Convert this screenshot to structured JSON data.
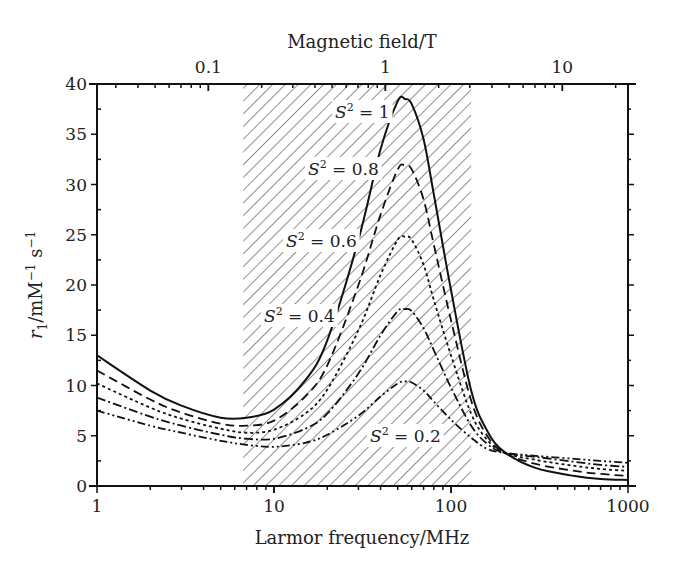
{
  "chart_data": {
    "type": "line",
    "title": "",
    "xlabel": "Larmor frequency/MHz",
    "x2label": "Magnetic field/T",
    "ylabel": "r1/mM-1 s-1",
    "xscale": "log",
    "xlim": [
      1,
      1000
    ],
    "ylim": [
      0,
      40
    ],
    "x_ticks": [
      1,
      10,
      100,
      1000
    ],
    "x_tick_labels": [
      "1",
      "10",
      "100",
      "1000"
    ],
    "x2_ticks": [
      0.1,
      1,
      10
    ],
    "x2_tick_labels": [
      "0.1",
      "1",
      "10"
    ],
    "y_ticks": [
      0,
      5,
      10,
      15,
      20,
      25,
      30,
      35,
      40
    ],
    "y_tick_labels": [
      "0",
      "5",
      "10",
      "15",
      "20",
      "25",
      "30",
      "35",
      "40"
    ],
    "shaded_region": {
      "x_from": 6.7,
      "x_to": 130,
      "pattern": "diagonal-hatch"
    },
    "x": [
      1,
      2,
      3,
      5,
      7,
      10,
      15,
      20,
      30,
      40,
      50,
      55,
      60,
      70,
      80,
      100,
      130,
      160,
      200,
      300,
      500,
      700,
      1000
    ],
    "series": [
      {
        "name": "S2 = 1",
        "label": "S² = 1",
        "style": "solid",
        "values": [
          13.0,
          9.5,
          8.0,
          6.8,
          6.8,
          7.6,
          10.5,
          14.5,
          24.5,
          33.5,
          38.3,
          38.5,
          38.0,
          34.5,
          29.0,
          19.5,
          9.5,
          5.5,
          3.4,
          1.8,
          1.0,
          0.7,
          0.6
        ]
      },
      {
        "name": "S2 = 0.8",
        "label": "S² = 0.8",
        "style": "dashed",
        "values": [
          11.5,
          8.6,
          7.3,
          6.2,
          6.0,
          6.5,
          8.9,
          12.0,
          20.0,
          27.0,
          31.5,
          31.9,
          31.5,
          28.5,
          24.0,
          16.5,
          8.5,
          5.0,
          3.3,
          2.2,
          1.5,
          1.2,
          1.0
        ]
      },
      {
        "name": "S2 = 0.6",
        "label": "S² = 0.6",
        "style": "dotted",
        "values": [
          10.2,
          7.8,
          6.7,
          5.7,
          5.3,
          5.6,
          7.2,
          9.6,
          15.5,
          21.0,
          24.5,
          24.8,
          24.5,
          22.0,
          18.5,
          13.0,
          7.2,
          4.6,
          3.3,
          2.6,
          2.0,
          1.7,
          1.5
        ]
      },
      {
        "name": "S2 = 0.4",
        "label": "S² = 0.4",
        "style": "dash-dot",
        "values": [
          8.8,
          6.9,
          6.0,
          5.1,
          4.7,
          4.7,
          5.7,
          7.2,
          11.2,
          15.0,
          17.4,
          17.6,
          17.4,
          15.7,
          13.5,
          9.8,
          6.0,
          4.2,
          3.3,
          2.9,
          2.4,
          2.1,
          1.9
        ]
      },
      {
        "name": "S2 = 0.2",
        "label": "S² = 0.2",
        "style": "dash-dot-dot",
        "values": [
          7.5,
          6.0,
          5.3,
          4.5,
          4.1,
          3.9,
          4.3,
          5.1,
          7.0,
          8.9,
          10.2,
          10.4,
          10.3,
          9.5,
          8.4,
          6.6,
          4.8,
          3.7,
          3.3,
          3.0,
          2.7,
          2.5,
          2.3
        ]
      }
    ],
    "annotations": [
      {
        "text_base": "S",
        "text_sup": "2",
        "text_tail": " = 1",
        "x": 335,
        "y": 118
      },
      {
        "text_base": "S",
        "text_sup": "2",
        "text_tail": " = 0.8",
        "x": 308,
        "y": 175
      },
      {
        "text_base": "S",
        "text_sup": "2",
        "text_tail": " = 0.6",
        "x": 286,
        "y": 247
      },
      {
        "text_base": "S",
        "text_sup": "2",
        "text_tail": " = 0.4",
        "x": 264,
        "y": 322
      },
      {
        "text_base": "S",
        "text_sup": "2",
        "text_tail": " = 0.2",
        "x": 370,
        "y": 442
      }
    ],
    "grid": false,
    "legend": "none (inline labels)"
  }
}
